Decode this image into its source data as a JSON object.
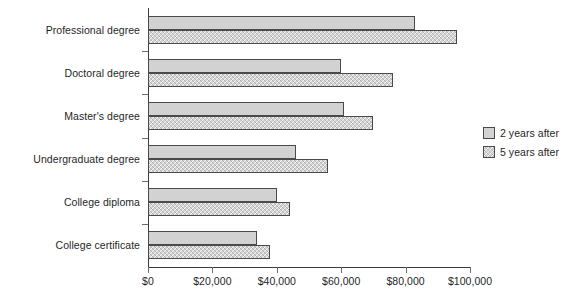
{
  "chart_data": {
    "type": "bar",
    "orientation": "horizontal",
    "title": "",
    "subtitle": "",
    "xlabel": "",
    "ylabel": "",
    "xlim": [
      0,
      100000
    ],
    "xticks": [
      0,
      20000,
      40000,
      60000,
      80000,
      100000
    ],
    "xtick_labels": [
      "$0",
      "$20,000",
      "$40,000",
      "$60,000",
      "$80,000",
      "$100,000"
    ],
    "grid": false,
    "legend_position": "right",
    "categories": [
      "Professional degree",
      "Doctoral degree",
      "Master's degree",
      "Undergraduate degree",
      "College diploma",
      "College certificate"
    ],
    "series": [
      {
        "name": "2 years after",
        "fill": "solid",
        "color": "#d2d2d2",
        "values": [
          83000,
          60000,
          61000,
          46000,
          40000,
          34000
        ]
      },
      {
        "name": "5 years after",
        "fill": "hatched",
        "color": "#d2d2d2",
        "values": [
          96000,
          76000,
          70000,
          56000,
          44000,
          38000
        ]
      }
    ]
  },
  "legend": {
    "items": [
      {
        "label": "2 years after"
      },
      {
        "label": "5 years after"
      }
    ]
  },
  "colors": {
    "bar_fill": "#d2d2d2",
    "bar_stroke": "#4a4a4a",
    "axis": "#3c3c3c",
    "text": "#1f1f1f",
    "background": "#ffffff"
  }
}
